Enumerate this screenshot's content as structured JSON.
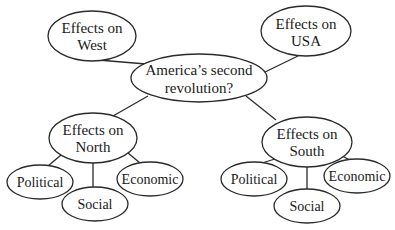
{
  "diagram": {
    "type": "concept-map",
    "colors": {
      "stroke": "#2a2a2a",
      "text": "#1a1a1a",
      "background": "#ffffff"
    },
    "center": {
      "line1": "America’s second",
      "line2": "revolution?"
    },
    "west": {
      "line1": "Effects on",
      "line2": "West"
    },
    "usa": {
      "line1": "Effects on",
      "line2": "USA"
    },
    "north": {
      "line1": "Effects on",
      "line2": "North",
      "children": {
        "political": "Political",
        "social": "Social",
        "economic": "Economic"
      }
    },
    "south": {
      "line1": "Effects on",
      "line2": "South",
      "children": {
        "political": "Political",
        "social": "Social",
        "economic": "Economic"
      }
    }
  }
}
